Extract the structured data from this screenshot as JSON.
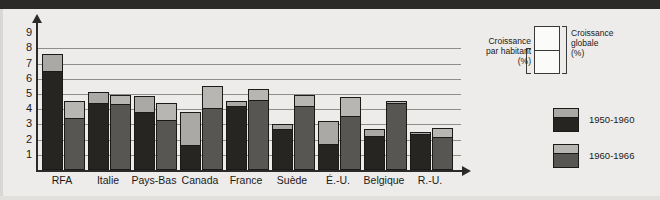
{
  "chart_data": {
    "type": "bar",
    "title": "",
    "subtitle": "",
    "xlabel": "",
    "ylabel": "",
    "ylim": [
      0,
      9
    ],
    "yticks": [
      1,
      2,
      3,
      4,
      5,
      6,
      7,
      8,
      9
    ],
    "grid": true,
    "stacked": true,
    "legend_position": "right",
    "categories": [
      "RFA",
      "Italie",
      "Pays-Bas",
      "Canada",
      "France",
      "Suède",
      "É.-U.",
      "Belgique",
      "R.-U."
    ],
    "series": [
      {
        "name": "1950-1960",
        "sub": "Croissance par habitant (%)",
        "values": [
          6.4,
          4.3,
          3.7,
          1.5,
          4.05,
          2.55,
          1.55,
          2.1,
          2.25
        ]
      },
      {
        "name": "1950-1960",
        "sub": "Croissance globale (%)",
        "values": [
          7.65,
          5.15,
          4.85,
          3.8,
          4.55,
          3.05,
          3.25,
          2.7,
          2.5
        ]
      },
      {
        "name": "1960-1966",
        "sub": "Croissance par habitant (%)",
        "values": [
          3.3,
          4.2,
          3.15,
          3.95,
          4.45,
          4.05,
          3.4,
          4.25,
          2.05
        ]
      },
      {
        "name": "1960-1966",
        "sub": "Croissance globale (%)",
        "values": [
          4.55,
          4.95,
          4.4,
          5.55,
          5.35,
          4.95,
          4.8,
          4.55,
          2.75
        ]
      }
    ],
    "annotations": [
      "Croissance par habitant (%)",
      "Croissance globale (%)"
    ]
  },
  "yaxis": {
    "ticks": [
      "9",
      "8",
      "7",
      "6",
      "5",
      "4",
      "3",
      "2",
      "1"
    ]
  },
  "xaxis": {
    "labels": [
      "RFA",
      "Italie",
      "Pays-Bas",
      "Canada",
      "France",
      "Suède",
      "É.-U.",
      "Belgique",
      "R.-U."
    ]
  },
  "legend_top": {
    "left_label": "Croissance\npar habitant\n(%)",
    "left_line1": "Croissance",
    "left_line2": "par habitant",
    "left_line3": "(%)",
    "right_line1": "Croissance",
    "right_line2": "globale",
    "right_line3": "(%)"
  },
  "legend_bottom": {
    "items": [
      {
        "label": "1950-1960",
        "top_color": "#aaa9a6",
        "bottom_color": "#262522"
      },
      {
        "label": "1960-1966",
        "top_color": "#b7b6b2",
        "bottom_color": "#575653"
      }
    ]
  },
  "colors": {
    "background": "#edecea",
    "band": "#2b2a28",
    "axis": "#2b2a28",
    "grid": "#8e8d8a",
    "series1_dark": "#262522",
    "series1_light": "#aaa9a6",
    "series2_dark": "#575653",
    "series2_light": "#b7b6b2",
    "text": "#1b1a19"
  }
}
